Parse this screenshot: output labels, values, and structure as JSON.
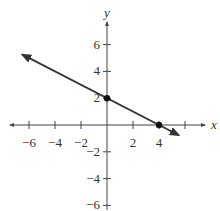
{
  "chart_data": {
    "type": "line",
    "title": "",
    "xlabel": "x",
    "ylabel": "y",
    "xlim": [
      -7,
      7
    ],
    "ylim": [
      -6.5,
      7.5
    ],
    "grid": false,
    "legend": null,
    "x_ticks": [
      -6,
      -4,
      -2,
      2,
      4
    ],
    "y_ticks": [
      6,
      4,
      2,
      -2,
      -4,
      -6
    ],
    "x_tick_labels": [
      "−6",
      "−4",
      "−2",
      "2",
      "4"
    ],
    "y_tick_labels": [
      "6",
      "4",
      "2",
      "−2",
      "−4",
      "−6"
    ],
    "series": [
      {
        "name": "line",
        "equation": "y = -x/2 + 2",
        "slope": -0.5,
        "intercept": 2,
        "x": [
          -6.5,
          0,
          4,
          5.5
        ],
        "y": [
          5.25,
          2,
          0,
          -0.75
        ],
        "arrows_both_ends": true
      }
    ],
    "points": [
      {
        "x": 0,
        "y": 2,
        "label": "y-intercept"
      },
      {
        "x": 4,
        "y": 0,
        "label": "x-intercept"
      }
    ],
    "colors": {
      "line": "#333333",
      "axis": "#444444",
      "point": "#111111"
    }
  }
}
